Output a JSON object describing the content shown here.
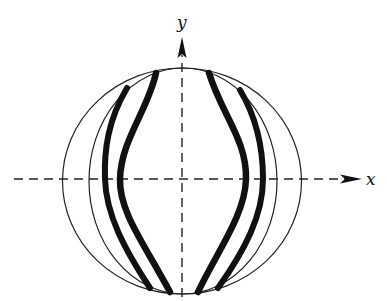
{
  "diagram": {
    "axes": {
      "x_label": "x",
      "y_label": "y"
    },
    "colors": {
      "ink": "#111111",
      "background": "#ffffff"
    },
    "shapes": {
      "outer_circle": "outer boundary ellipse",
      "inner_circle": "inner boundary ellipse",
      "strands": [
        "outer-left thick curve",
        "inner-left thick curve",
        "inner-right thick curve",
        "outer-right thick curve"
      ]
    }
  }
}
